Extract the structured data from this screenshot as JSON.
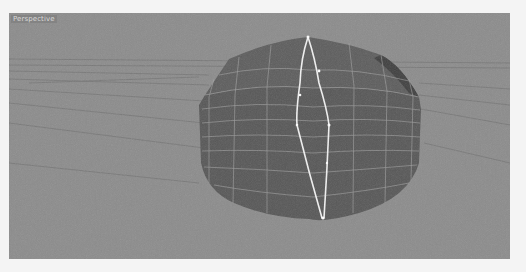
{
  "viewport": {
    "label": "Perspective",
    "background_color": "#8b8b8b",
    "object_color": "#575757",
    "wire_color": "#a8a8a8",
    "selected_edge_color": "#f2f2f2",
    "horizon_line_color": "#6e6e6e"
  },
  "scene": {
    "object": "polygon-mesh",
    "selection": "edge-loop"
  }
}
